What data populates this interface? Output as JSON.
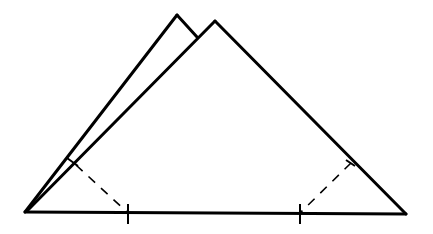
{
  "diagram": {
    "type": "folded-paper-triangle",
    "colors": {
      "stroke": "#000000",
      "background": "#ffffff"
    },
    "shapes": {
      "back_triangle": {
        "apex": [
          177,
          15
        ],
        "left_base": [
          25,
          212
        ],
        "visible_right_edge_end": [
          197,
          37
        ]
      },
      "front_triangle": {
        "apex": [
          215,
          21
        ],
        "left_base": [
          25,
          212
        ],
        "right_base": [
          406,
          214
        ]
      },
      "baseline": {
        "from": [
          25,
          212
        ],
        "to": [
          406,
          214
        ]
      },
      "fold_lines": [
        {
          "name": "left-fold",
          "from": [
            75,
            164
          ],
          "to": [
            128,
            213
          ],
          "style": "dashed"
        },
        {
          "name": "right-fold",
          "from": [
            351,
            163
          ],
          "to": [
            300,
            213
          ],
          "style": "dashed"
        }
      ],
      "ticks": [
        {
          "name": "baseline-tick-left",
          "x": 128,
          "y1": 204,
          "y2": 224
        },
        {
          "name": "baseline-tick-right",
          "x": 300,
          "y1": 204,
          "y2": 224
        },
        {
          "name": "left-edge-tick",
          "from": [
            67,
            158
          ],
          "to": [
            78,
            166
          ]
        },
        {
          "name": "right-edge-tick",
          "from": [
            346,
            160
          ],
          "to": [
            355,
            166
          ]
        }
      ]
    }
  }
}
